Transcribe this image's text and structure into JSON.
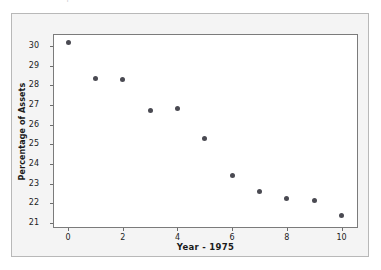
{
  "panel": {
    "background_color": "#f4f4f4",
    "border_color": "#b8b8b8"
  },
  "top_bleed": {
    "sliver_text": "rmation from a spreadsheet"
  },
  "chart_data": {
    "type": "scatter",
    "title": "",
    "subtitle": "",
    "xlabel": "Year - 1975",
    "ylabel": "Percentage of Assets",
    "x": [
      0,
      1,
      2,
      3,
      4,
      5,
      6,
      7,
      8,
      9,
      10
    ],
    "values": [
      30.15,
      28.35,
      28.3,
      26.7,
      26.8,
      25.3,
      23.4,
      22.6,
      22.25,
      22.15,
      21.4
    ],
    "series": [
      {
        "name": "Percentage of Assets",
        "marker": "filled-circle",
        "marker_color": "#4a4a52",
        "marker_size_px": 5,
        "points": [
          {
            "x": 0,
            "y": 30.15
          },
          {
            "x": 1,
            "y": 28.35
          },
          {
            "x": 2,
            "y": 28.3
          },
          {
            "x": 3,
            "y": 26.7
          },
          {
            "x": 4,
            "y": 26.8
          },
          {
            "x": 5,
            "y": 25.3
          },
          {
            "x": 6,
            "y": 23.4
          },
          {
            "x": 7,
            "y": 22.6
          },
          {
            "x": 8,
            "y": 22.25
          },
          {
            "x": 9,
            "y": 22.15
          },
          {
            "x": 10,
            "y": 21.4
          }
        ]
      }
    ],
    "xlim": [
      -0.55,
      10.6
    ],
    "ylim": [
      20.75,
      30.6
    ],
    "xticks": [
      0,
      2,
      4,
      6,
      8,
      10
    ],
    "xtick_labels": [
      "0",
      "2",
      "4",
      "6",
      "8",
      "10"
    ],
    "yticks": [
      21,
      22,
      23,
      24,
      25,
      26,
      27,
      28,
      29,
      30
    ],
    "ytick_labels": [
      "21",
      "22",
      "23",
      "24",
      "25",
      "26",
      "27",
      "28",
      "29",
      "30"
    ],
    "grid": false,
    "legend": null,
    "legend_position": "none",
    "frame_color": "#7b7b7b",
    "plot_background": "#ffffff",
    "annotations": []
  }
}
